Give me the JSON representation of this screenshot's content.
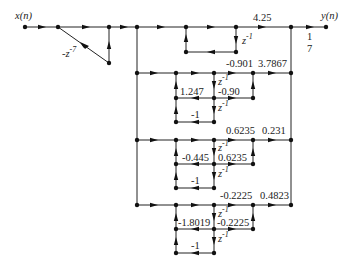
{
  "diagram": {
    "type": "signal-flow-graph",
    "input_label": "x(n)",
    "output_label": "y(n)",
    "comb_gain": "-z",
    "comb_exp": "-7",
    "output_gain_num": "1",
    "output_gain_den": "7",
    "first_order": {
      "gain": "4.25",
      "delay": "z",
      "delay_exp": "-1"
    },
    "sections": [
      {
        "top_coef": "-0.901",
        "out_gain": "3.7867",
        "feedback_a1": "1.247",
        "feed_coef": "-0.90",
        "feedback_a2": "-1",
        "delay": "z",
        "delay_exp": "-1"
      },
      {
        "top_coef": "0.6235",
        "out_gain": "0.231",
        "feedback_a1": "-0.445",
        "feed_coef": "0.6235",
        "feedback_a2": "-1",
        "delay": "z",
        "delay_exp": "-1"
      },
      {
        "top_coef": "-0.2225",
        "out_gain": "0.4823",
        "feedback_a1": "-1.8019",
        "feed_coef": "-0.2225",
        "feedback_a2": "-1",
        "delay": "z",
        "delay_exp": "-1"
      }
    ]
  }
}
